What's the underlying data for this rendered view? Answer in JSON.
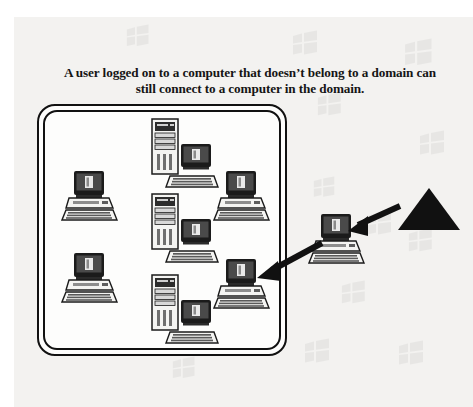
{
  "figure": {
    "caption": "A user logged on to a computer that doesn’t belong to a domain can still connect to a computer in the domain.",
    "background_color": "#f3f2f0",
    "ink_color": "#111111",
    "page_color": "#ffffff"
  },
  "domain_boundary": {
    "name": "domain",
    "style": "double rounded rectangle",
    "x": 37,
    "y": 104,
    "width": 250,
    "height": 252
  },
  "nodes": [
    {
      "id": "workstation-top-left",
      "type": "workstation",
      "inside_domain": true,
      "x": 61,
      "y": 170,
      "width": 58,
      "height": 52
    },
    {
      "id": "workstation-bottom-left",
      "type": "workstation",
      "inside_domain": true,
      "x": 61,
      "y": 252,
      "width": 58,
      "height": 52
    },
    {
      "id": "workstation-top-right",
      "type": "workstation",
      "inside_domain": true,
      "x": 213,
      "y": 170,
      "width": 58,
      "height": 52
    },
    {
      "id": "workstation-bottom-right",
      "type": "workstation",
      "inside_domain": true,
      "x": 213,
      "y": 258,
      "width": 58,
      "height": 52
    },
    {
      "id": "server-group-top",
      "type": "server",
      "inside_domain": true,
      "x": 148,
      "y": 118,
      "width": 72,
      "height": 72
    },
    {
      "id": "server-group-middle",
      "type": "server",
      "inside_domain": true,
      "x": 148,
      "y": 193,
      "width": 72,
      "height": 72
    },
    {
      "id": "server-group-bottom",
      "type": "server",
      "inside_domain": true,
      "x": 148,
      "y": 274,
      "width": 72,
      "height": 72
    },
    {
      "id": "workstation-external",
      "type": "workstation",
      "inside_domain": false,
      "x": 308,
      "y": 213,
      "width": 58,
      "height": 52
    }
  ],
  "triangle": {
    "id": "user-marker-triangle",
    "fill": "#111111",
    "x": 398,
    "y": 188,
    "width": 62,
    "height": 42
  },
  "arrows": [
    {
      "id": "arrow-triangle-to-external-computer",
      "from": "user-marker-triangle",
      "to": "workstation-external",
      "x1": 400,
      "y1": 208,
      "x2": 348,
      "y2": 231
    },
    {
      "id": "arrow-external-to-domain-computer",
      "from": "workstation-external",
      "to": "workstation-bottom-right",
      "x1": 322,
      "y1": 243,
      "x2": 257,
      "y2": 278
    }
  ],
  "watermarks": {
    "icon": "windows-flag-icon",
    "count": 12,
    "opacity": 0.5,
    "positions": [
      {
        "x": 126,
        "y": 24,
        "scale": 0.9
      },
      {
        "x": 292,
        "y": 30,
        "scale": 1.0
      },
      {
        "x": 404,
        "y": 38,
        "scale": 1.1
      },
      {
        "x": 317,
        "y": 92,
        "scale": 0.95
      },
      {
        "x": 419,
        "y": 130,
        "scale": 1.0
      },
      {
        "x": 313,
        "y": 176,
        "scale": 0.85
      },
      {
        "x": 366,
        "y": 210,
        "scale": 1.0
      },
      {
        "x": 408,
        "y": 228,
        "scale": 0.95
      },
      {
        "x": 341,
        "y": 280,
        "scale": 0.95
      },
      {
        "x": 304,
        "y": 338,
        "scale": 1.0
      },
      {
        "x": 398,
        "y": 340,
        "scale": 1.0
      },
      {
        "x": 172,
        "y": 356,
        "scale": 0.9
      }
    ]
  }
}
